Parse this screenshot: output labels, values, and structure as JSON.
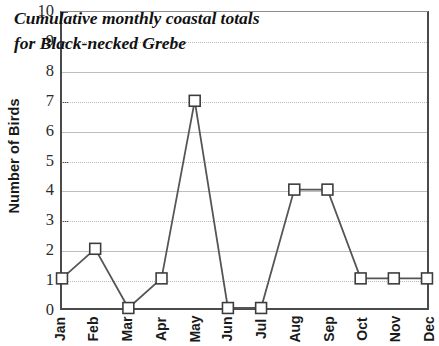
{
  "chart_data": {
    "type": "line",
    "title_lines": [
      "Cumulative monthly coastal totals",
      "for Black-necked Grebe"
    ],
    "xlabel": "",
    "ylabel": "Number of Birds",
    "categories": [
      "Jan",
      "Feb",
      "Mar",
      "Apr",
      "May",
      "Jun",
      "Jul",
      "Aug",
      "Sep",
      "Oct",
      "Nov",
      "Dec"
    ],
    "values": [
      1,
      2,
      0,
      1,
      7,
      0,
      0,
      4,
      4,
      1,
      1,
      1
    ],
    "series": [
      {
        "name": "Black-necked Grebe",
        "values": [
          1,
          2,
          0,
          1,
          7,
          0,
          0,
          4,
          4,
          1,
          1,
          1
        ]
      }
    ],
    "ylim": [
      0,
      10
    ],
    "ytick_labels": [
      "0",
      "1",
      "2",
      "3",
      "4",
      "5",
      "6",
      "7",
      "8",
      "9",
      "10"
    ],
    "ytick_values": [
      0,
      1,
      2,
      3,
      4,
      5,
      6,
      7,
      8,
      9,
      10
    ],
    "grid": true,
    "grid_axis": "y",
    "legend": false,
    "marker": "square-open",
    "line_color": "#555555",
    "marker_fill": "#ffffff",
    "marker_edge": "#3c3c3c",
    "grid_color": "#b9b9b9",
    "axis_color": "#4a4a4a",
    "background": "#ffffff"
  }
}
